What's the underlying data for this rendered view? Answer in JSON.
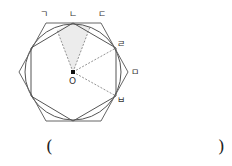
{
  "figure": {
    "labels": {
      "g": "ㄱ",
      "n": "ㄴ",
      "d": "ㄷ",
      "r": "ㄹ",
      "m": "ㅁ",
      "b": "ㅂ",
      "center": "O"
    },
    "colors": {
      "stroke": "#555555",
      "shade": "#ececec",
      "dash": "#777777"
    }
  },
  "answer": {
    "open": "(",
    "close": ")"
  }
}
